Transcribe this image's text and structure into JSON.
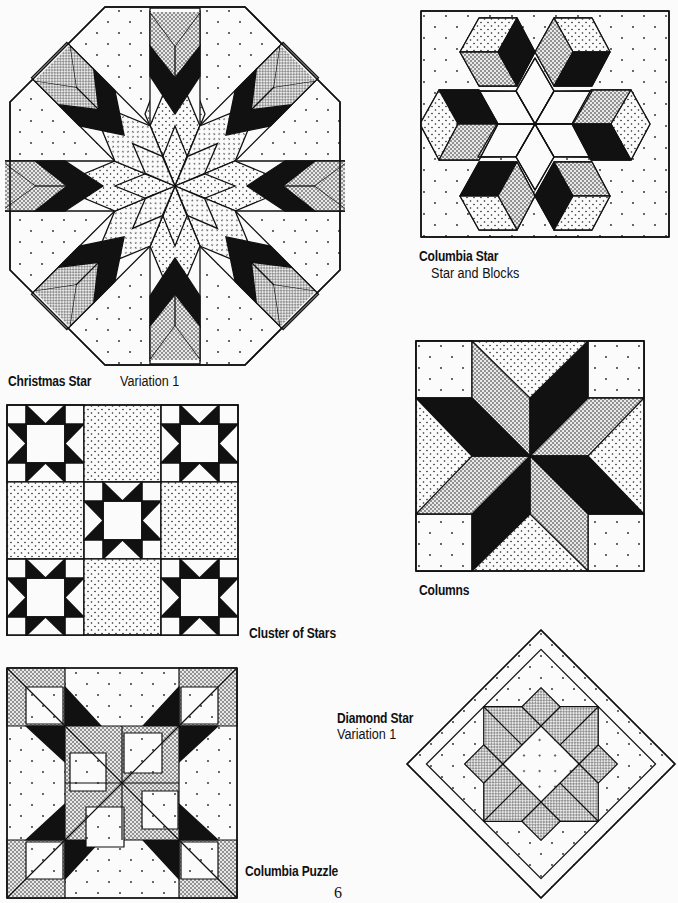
{
  "page": {
    "number": "6",
    "colors": {
      "ink": "#111111",
      "paper": "#fbfbfb"
    }
  },
  "blocks": [
    {
      "id": "christmas-star",
      "title": "Christmas Star",
      "subtitle": "Variation 1"
    },
    {
      "id": "columbia-star",
      "title": "Columbia Star",
      "subtitle": "Star and Blocks"
    },
    {
      "id": "cluster-of-stars",
      "title": "Cluster of Stars",
      "subtitle": ""
    },
    {
      "id": "columns",
      "title": "Columns",
      "subtitle": ""
    },
    {
      "id": "diamond-star",
      "title": "Diamond Star",
      "subtitle": "Variation 1"
    },
    {
      "id": "columbia-puzzle",
      "title": "Columbia Puzzle",
      "subtitle": ""
    }
  ]
}
